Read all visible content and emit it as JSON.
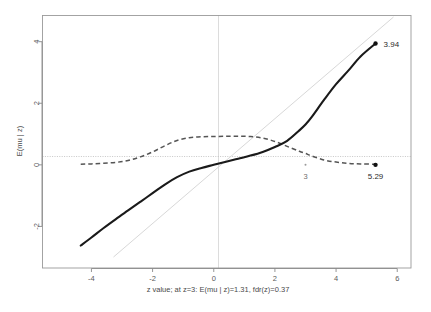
{
  "chart_data": {
    "type": "line",
    "title": "",
    "xlabel": "z value; at z=3: E(mu | z)=1.31, fdr(z)=0.37",
    "ylabel": "E(mu | z)",
    "xlim": [
      -5.6,
      6.45
    ],
    "ylim": [
      -3.35,
      4.85
    ],
    "xticks": [
      -4,
      -2,
      0,
      2,
      4,
      6
    ],
    "xtick_labels": [
      "-4",
      "-2",
      "0",
      "2",
      "4",
      "6"
    ],
    "yticks": [
      -2,
      0,
      2,
      4
    ],
    "ytick_labels": [
      "-2",
      "0",
      "2",
      "4"
    ],
    "grid": false,
    "legend": "none",
    "series": [
      {
        "name": "E(mu | z)",
        "style": "solid",
        "color": "#1a1a1a",
        "width": 2.1,
        "x": [
          -4.35,
          -4.0,
          -3.6,
          -3.2,
          -2.8,
          -2.4,
          -2.0,
          -1.6,
          -1.2,
          -0.8,
          -0.4,
          0.0,
          0.4,
          0.8,
          1.2,
          1.6,
          2.0,
          2.4,
          2.8,
          3.0,
          3.2,
          3.6,
          4.0,
          4.4,
          4.8,
          5.29
        ],
        "y": [
          -2.62,
          -2.36,
          -2.05,
          -1.76,
          -1.48,
          -1.2,
          -0.92,
          -0.64,
          -0.4,
          -0.22,
          -0.1,
          0.0,
          0.1,
          0.2,
          0.3,
          0.42,
          0.58,
          0.78,
          1.12,
          1.31,
          1.55,
          2.1,
          2.62,
          3.06,
          3.52,
          3.94
        ]
      },
      {
        "name": "fdr(z)",
        "style": "dashed",
        "color": "#555555",
        "width": 1.5,
        "x": [
          -4.35,
          -4.0,
          -3.6,
          -3.2,
          -2.8,
          -2.4,
          -2.0,
          -1.6,
          -1.2,
          -0.8,
          -0.4,
          0.0,
          0.4,
          0.8,
          1.2,
          1.6,
          2.0,
          2.4,
          2.8,
          3.0,
          3.2,
          3.6,
          4.0,
          4.4,
          4.8,
          5.29
        ],
        "y": [
          0.02,
          0.03,
          0.05,
          0.08,
          0.14,
          0.26,
          0.42,
          0.62,
          0.79,
          0.88,
          0.91,
          0.92,
          0.93,
          0.93,
          0.92,
          0.87,
          0.76,
          0.6,
          0.44,
          0.37,
          0.29,
          0.16,
          0.09,
          0.05,
          0.03,
          0.02
        ]
      },
      {
        "name": "identity-line",
        "style": "solid",
        "color": "#d6d6d6",
        "width": 1.0,
        "x": [
          -3.35,
          4.85
        ],
        "y": [
          -3.35,
          4.85
        ]
      }
    ],
    "reference_lines": [
      {
        "name": "zero-horizontal",
        "orientation": "horizontal",
        "value": 0,
        "style": "dotted",
        "color": "#b9b9b9"
      },
      {
        "name": "zero-vertical",
        "orientation": "vertical",
        "value": 0,
        "style": "solid",
        "color": "#d0d0d0"
      }
    ],
    "annotations": [
      {
        "name": "endpoint-value",
        "text": "3.94",
        "x": 5.29,
        "y": 3.94,
        "marker": true
      },
      {
        "name": "zmax-value",
        "text": "5.29",
        "x": 5.29,
        "y": 0.0,
        "marker": true
      },
      {
        "name": "z-three-tick",
        "text": "3",
        "x": 3.0,
        "y": 0.0,
        "marker": true
      }
    ]
  },
  "axis": {
    "x_title": "z value; at z=3: E(mu | z)=1.31, fdr(z)=0.37",
    "y_title": "E(mu | z)"
  },
  "ticks": {
    "x": [
      "-4",
      "-2",
      "0",
      "2",
      "4",
      "6"
    ],
    "y": [
      "-2",
      "0",
      "2",
      "4"
    ]
  },
  "labels": {
    "peak": "3.94",
    "zmax": "5.29",
    "zthree": "3"
  },
  "colors": {
    "curve": "#1a1a1a",
    "fdr": "#555555",
    "identity": "#d6d6d6",
    "axis": "#8a8a8a",
    "background": "#ffffff"
  }
}
